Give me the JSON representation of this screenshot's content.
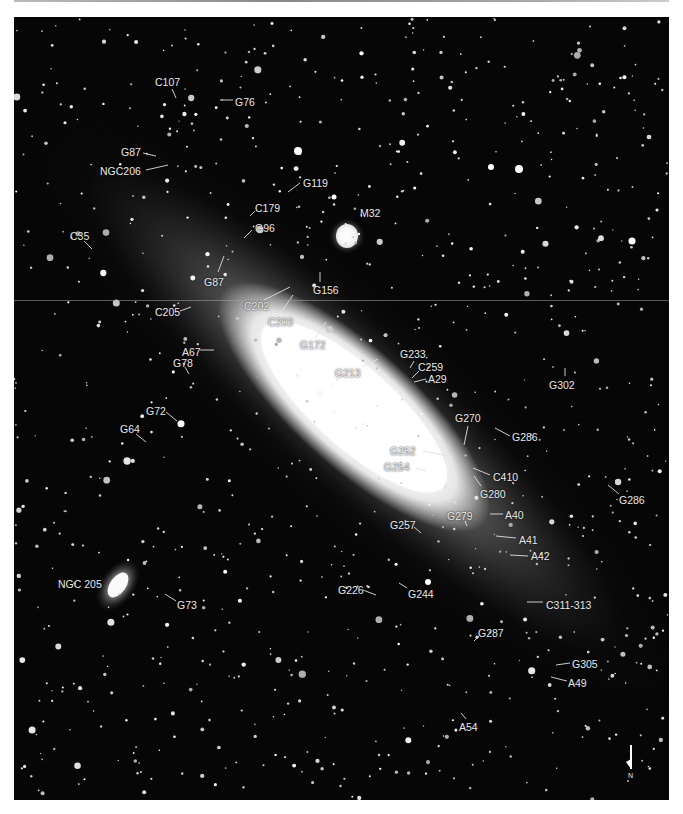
{
  "image": {
    "subject": "Andromeda Galaxy (M31) with satellite galaxies M32, NGC 205 and labeled globular clusters",
    "palette": {
      "background": "#060606",
      "star": "#ffffff",
      "label": "#e8e8e8",
      "page": "#ffffff"
    }
  },
  "companions": [
    {
      "id": "m32",
      "label": "M32",
      "x": 360,
      "y": 207,
      "lx1": 346,
      "ly1": 228,
      "lx2": 356,
      "ly2": 218
    },
    {
      "id": "ngc205",
      "label": "NGC 205",
      "x": 58,
      "y": 578
    }
  ],
  "labels": [
    {
      "text": "C107",
      "x": 155,
      "y": 76,
      "lx1": 172,
      "ly1": 89,
      "lx2": 176,
      "ly2": 98
    },
    {
      "text": "G76",
      "x": 235,
      "y": 96,
      "lx1": 220,
      "ly1": 100,
      "lx2": 233,
      "ly2": 100
    },
    {
      "text": "G87",
      "x": 121,
      "y": 146,
      "lx1": 143,
      "ly1": 153,
      "lx2": 156,
      "ly2": 156
    },
    {
      "text": "NGC206",
      "x": 100,
      "y": 165,
      "lx1": 146,
      "ly1": 170,
      "lx2": 168,
      "ly2": 165
    },
    {
      "text": "G119",
      "x": 303,
      "y": 177,
      "lx1": 288,
      "ly1": 192,
      "lx2": 300,
      "ly2": 183
    },
    {
      "text": "C179",
      "x": 255,
      "y": 202,
      "lx1": 250,
      "ly1": 216,
      "lx2": 255,
      "ly2": 211
    },
    {
      "text": "G96",
      "x": 255,
      "y": 222,
      "lx1": 244,
      "ly1": 238,
      "lx2": 252,
      "ly2": 230
    },
    {
      "text": "M32",
      "x": 360,
      "y": 207
    },
    {
      "text": "C35",
      "x": 70,
      "y": 230,
      "lx1": 84,
      "ly1": 241,
      "lx2": 92,
      "ly2": 249
    },
    {
      "text": "G87",
      "x": 204,
      "y": 276,
      "lx1": 218,
      "ly1": 272,
      "lx2": 224,
      "ly2": 256
    },
    {
      "text": "C202",
      "x": 244,
      "y": 300,
      "lx1": 264,
      "ly1": 300,
      "lx2": 290,
      "ly2": 287
    },
    {
      "text": "G156",
      "x": 313,
      "y": 284,
      "lx1": 320,
      "ly1": 272,
      "lx2": 320,
      "ly2": 282
    },
    {
      "text": "C205",
      "x": 155,
      "y": 306,
      "lx1": 180,
      "ly1": 311,
      "lx2": 191,
      "ly2": 307
    },
    {
      "text": "C203",
      "x": 268,
      "y": 316,
      "lx1": 280,
      "ly1": 314,
      "lx2": 293,
      "ly2": 295
    },
    {
      "text": "G172",
      "x": 300,
      "y": 339,
      "lx1": 315,
      "ly1": 338,
      "lx2": 326,
      "ly2": 322
    },
    {
      "text": "A67",
      "x": 182,
      "y": 346,
      "lx1": 200,
      "ly1": 350,
      "lx2": 214,
      "ly2": 350
    },
    {
      "text": "G233",
      "x": 400,
      "y": 348,
      "lx1": 410,
      "ly1": 368,
      "lx2": 414,
      "ly2": 361
    },
    {
      "text": "G213",
      "x": 335,
      "y": 367,
      "lx1": 362,
      "ly1": 367,
      "lx2": 378,
      "ly2": 359
    },
    {
      "text": "C259",
      "x": 418,
      "y": 361,
      "lx1": 412,
      "ly1": 378,
      "lx2": 419,
      "ly2": 371
    },
    {
      "text": "G78",
      "x": 173,
      "y": 357,
      "lx1": 185,
      "ly1": 367,
      "lx2": 189,
      "ly2": 374
    },
    {
      "text": "A29",
      "x": 428,
      "y": 373,
      "lx1": 414,
      "ly1": 382,
      "lx2": 426,
      "ly2": 379
    },
    {
      "text": "G302",
      "x": 549,
      "y": 379,
      "lx1": 565,
      "ly1": 368,
      "lx2": 565,
      "ly2": 376
    },
    {
      "text": "G72",
      "x": 146,
      "y": 405,
      "lx1": 166,
      "ly1": 412,
      "lx2": 177,
      "ly2": 421
    },
    {
      "text": "G270",
      "x": 455,
      "y": 412,
      "lx1": 468,
      "ly1": 426,
      "lx2": 464,
      "ly2": 445
    },
    {
      "text": "G286",
      "x": 512,
      "y": 431,
      "lx1": 495,
      "ly1": 428,
      "lx2": 510,
      "ly2": 436
    },
    {
      "text": "G64",
      "x": 120,
      "y": 423,
      "lx1": 136,
      "ly1": 434,
      "lx2": 146,
      "ly2": 442
    },
    {
      "text": "G252",
      "x": 390,
      "y": 445,
      "lx1": 423,
      "ly1": 451,
      "lx2": 450,
      "ly2": 456
    },
    {
      "text": "G254",
      "x": 384,
      "y": 461,
      "lx1": 416,
      "ly1": 468,
      "lx2": 426,
      "ly2": 471
    },
    {
      "text": "C410",
      "x": 493,
      "y": 471,
      "lx1": 473,
      "ly1": 468,
      "lx2": 490,
      "ly2": 475
    },
    {
      "text": "G280",
      "x": 480,
      "y": 488,
      "lx1": 474,
      "ly1": 476,
      "lx2": 481,
      "ly2": 486
    },
    {
      "text": "G286",
      "x": 619,
      "y": 494,
      "lx1": 608,
      "ly1": 485,
      "lx2": 619,
      "ly2": 494
    },
    {
      "text": "G279",
      "x": 447,
      "y": 510,
      "lx1": 465,
      "ly1": 521,
      "lx2": 467,
      "ly2": 526
    },
    {
      "text": "A40",
      "x": 505,
      "y": 509,
      "lx1": 490,
      "ly1": 514,
      "lx2": 503,
      "ly2": 514
    },
    {
      "text": "G257",
      "x": 390,
      "y": 519,
      "lx1": 414,
      "ly1": 527,
      "lx2": 421,
      "ly2": 533
    },
    {
      "text": "A41",
      "x": 519,
      "y": 534,
      "lx1": 496,
      "ly1": 536,
      "lx2": 516,
      "ly2": 538
    },
    {
      "text": "A42",
      "x": 531,
      "y": 550,
      "lx1": 510,
      "ly1": 555,
      "lx2": 528,
      "ly2": 556
    },
    {
      "text": "NGC 205",
      "x": 58,
      "y": 578
    },
    {
      "text": "G226",
      "x": 338,
      "y": 584,
      "lx1": 363,
      "ly1": 590,
      "lx2": 376,
      "ly2": 595
    },
    {
      "text": "G244",
      "x": 408,
      "y": 588,
      "lx1": 399,
      "ly1": 583,
      "lx2": 407,
      "ly2": 588
    },
    {
      "text": "G73",
      "x": 177,
      "y": 599,
      "lx1": 165,
      "ly1": 594,
      "lx2": 176,
      "ly2": 601
    },
    {
      "text": "C311-313",
      "x": 546,
      "y": 599,
      "lx1": 527,
      "ly1": 602,
      "lx2": 543,
      "ly2": 602
    },
    {
      "text": "G287",
      "x": 478,
      "y": 627,
      "lx1": 474,
      "ly1": 641,
      "lx2": 480,
      "ly2": 635
    },
    {
      "text": "G305",
      "x": 572,
      "y": 658,
      "lx1": 556,
      "ly1": 665,
      "lx2": 570,
      "ly2": 663
    },
    {
      "text": "A49",
      "x": 568,
      "y": 677,
      "lx1": 551,
      "ly1": 677,
      "lx2": 567,
      "ly2": 681
    },
    {
      "text": "A54",
      "x": 459,
      "y": 721,
      "lx1": 461,
      "ly1": 713,
      "lx2": 466,
      "ly2": 719
    }
  ],
  "compass": {
    "label": "N",
    "x": 630,
    "y": 745
  }
}
